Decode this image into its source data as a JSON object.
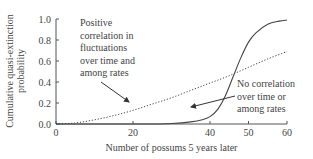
{
  "chart_data": {
    "type": "line",
    "title": "",
    "xlabel": "Number of possums 5 years later",
    "ylabel": "Cumulative quasi-extinction probability",
    "ylabel_lines": [
      "Cumulative quasi-extinction",
      "probability"
    ],
    "xlim": [
      0,
      60
    ],
    "ylim": [
      0,
      1.0
    ],
    "xticks": [
      "0",
      "20",
      "40",
      "50",
      "60"
    ],
    "yticks": [
      "0.0",
      "0.2",
      "0.4",
      "0.6",
      "0.8",
      "1.0"
    ],
    "grid": false,
    "legend": "none (annotations with arrows)",
    "series": [
      {
        "name": "Positive correlation in fluctuations over time and among rates",
        "style": "dotted",
        "x": [
          0,
          5,
          10,
          15,
          20,
          25,
          30,
          35,
          40,
          45,
          50,
          55,
          60
        ],
        "values": [
          0.0,
          0.01,
          0.04,
          0.08,
          0.13,
          0.19,
          0.25,
          0.32,
          0.39,
          0.46,
          0.54,
          0.62,
          0.69
        ]
      },
      {
        "name": "No correlation over time or among rates",
        "style": "solid",
        "x": [
          0,
          10,
          20,
          25,
          30,
          35,
          38,
          40,
          42,
          44,
          46,
          48,
          50,
          52,
          55,
          58,
          60
        ],
        "values": [
          0.0,
          0.0,
          0.0,
          0.0,
          0.005,
          0.02,
          0.04,
          0.07,
          0.14,
          0.27,
          0.45,
          0.63,
          0.78,
          0.87,
          0.95,
          0.98,
          0.99
        ]
      }
    ],
    "annotations": [
      {
        "text_lines": [
          "Positive",
          "correlation in",
          "fluctuations",
          "over time and",
          "among rates"
        ],
        "points_to": "dotted"
      },
      {
        "text_lines": [
          "No correlation",
          "over time or",
          "among rates"
        ],
        "points_to": "solid"
      }
    ]
  }
}
